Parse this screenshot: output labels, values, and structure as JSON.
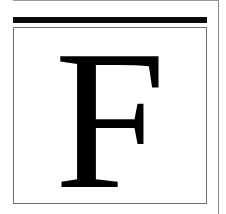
{
  "drop_cap": {
    "letter": "F"
  },
  "colors": {
    "letter": "#000000",
    "bar": "#0a0a0a",
    "box_border": "#6e6e6e",
    "rule": "#8a8a8a"
  }
}
